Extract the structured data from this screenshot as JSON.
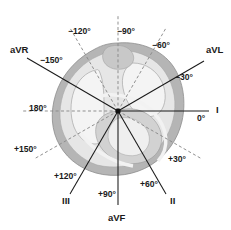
{
  "figure": {
    "name": "hexaxial-reference-system",
    "background_color": "#ffffff",
    "center": {
      "x": 118,
      "y": 111
    }
  },
  "leads": [
    {
      "id": "aVR",
      "label": "aVR",
      "angle_deg": -150,
      "line_style": "solid",
      "x": 10,
      "y": 45
    },
    {
      "id": "aVL",
      "label": "aVL",
      "angle_deg": -30,
      "line_style": "solid",
      "x": 206,
      "y": 45
    },
    {
      "id": "I",
      "label": "I",
      "angle_deg": 0,
      "line_style": "solid",
      "x": 216,
      "y": 105
    },
    {
      "id": "II",
      "label": "II",
      "angle_deg": 60,
      "line_style": "solid",
      "x": 170,
      "y": 196
    },
    {
      "id": "III",
      "label": "III",
      "angle_deg": 120,
      "line_style": "solid",
      "x": 62,
      "y": 196
    },
    {
      "id": "aVF",
      "label": "aVF",
      "angle_deg": 90,
      "line_style": "solid",
      "x": 108,
      "y": 213
    }
  ],
  "angles": [
    {
      "id": "neg150",
      "label": "−150°",
      "value_deg": -150,
      "line_style": "solid",
      "x": 40,
      "y": 56
    },
    {
      "id": "neg120",
      "label": "−120°",
      "value_deg": -120,
      "line_style": "dashed",
      "x": 68,
      "y": 27
    },
    {
      "id": "neg90",
      "label": "−90°",
      "value_deg": -90,
      "line_style": "dashed",
      "x": 117,
      "y": 27
    },
    {
      "id": "neg60",
      "label": "−60°",
      "value_deg": -60,
      "line_style": "dashed",
      "x": 152,
      "y": 41
    },
    {
      "id": "neg30",
      "label": "−30°",
      "value_deg": -30,
      "line_style": "solid",
      "x": 175,
      "y": 73
    },
    {
      "id": "zero",
      "label": "0°",
      "value_deg": 0,
      "line_style": "solid",
      "x": 197,
      "y": 114
    },
    {
      "id": "pos30",
      "label": "+30°",
      "value_deg": 30,
      "line_style": "dashed",
      "x": 168,
      "y": 155
    },
    {
      "id": "pos60",
      "label": "+60°",
      "value_deg": 60,
      "line_style": "solid",
      "x": 140,
      "y": 180
    },
    {
      "id": "pos90",
      "label": "+90°",
      "value_deg": 90,
      "line_style": "solid",
      "x": 98,
      "y": 190
    },
    {
      "id": "pos120",
      "label": "+120°",
      "value_deg": 120,
      "line_style": "solid",
      "x": 54,
      "y": 172
    },
    {
      "id": "pos150",
      "label": "+150°",
      "value_deg": 150,
      "line_style": "dashed",
      "x": 14,
      "y": 145
    },
    {
      "id": "oneEighty",
      "label": "180°",
      "value_deg": 180,
      "line_style": "dashed",
      "x": 29,
      "y": 104
    }
  ],
  "colors": {
    "line_solid": "#1a1a1a",
    "line_dashed": "#8a8a8a",
    "thorax_fill": "#b5b5b5",
    "lung_fill": "#f4f4f4",
    "heart_fill": "#d2d2d2",
    "text": "#1a1a1a",
    "background": "#ffffff"
  }
}
